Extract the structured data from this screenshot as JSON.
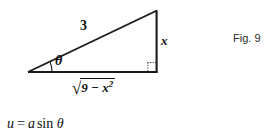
{
  "figure": {
    "caption": "Fig. 9",
    "type": "right-triangle-diagram",
    "line_color": "#1a1a1a",
    "background": "#ffffff",
    "labels": {
      "hypotenuse": "3",
      "opposite_side": "x",
      "adjacent_side_sqrt_sign": "√",
      "adjacent_side_radicand_base": "9 − x",
      "adjacent_side_radicand_exponent": "2",
      "adjacent_side_full": "√(9 − x²)",
      "angle": "θ"
    },
    "markers": {
      "right_angle": "dotted-square",
      "angle_arc": "theta-arc"
    },
    "geometry": {
      "left_vertex": [
        28,
        72
      ],
      "right_vertex": [
        157,
        72
      ],
      "apex_vertex": [
        157,
        11
      ],
      "hypotenuse_label_position": [
        80,
        19
      ],
      "opposite_label_position": [
        161,
        34
      ],
      "adjacent_label_position": [
        72,
        78
      ],
      "theta_label_position": [
        55,
        54
      ]
    }
  },
  "equation": {
    "lhs": "u",
    "operator": "=",
    "coefficient": "a",
    "function": "sin",
    "argument": "θ",
    "full_text": "u = a sin θ"
  }
}
